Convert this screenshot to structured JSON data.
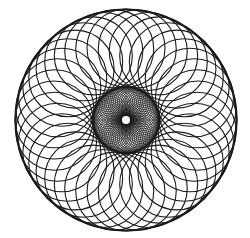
{
  "figure": {
    "background": "#ffffff",
    "stroke_color": "#1a1a1a",
    "center": [
      126,
      120
    ],
    "outer_ring": {
      "circle_count": 40,
      "center_distance": 72,
      "circle_radius": 39,
      "stroke_width": 1.1,
      "rim_stroke_width": 2.2
    },
    "inner_ring": {
      "circle_count": 60,
      "center_distance": 18.5,
      "circle_radius": 14.5,
      "stroke_width": 0.8
    },
    "center_hole_radius": 4
  }
}
